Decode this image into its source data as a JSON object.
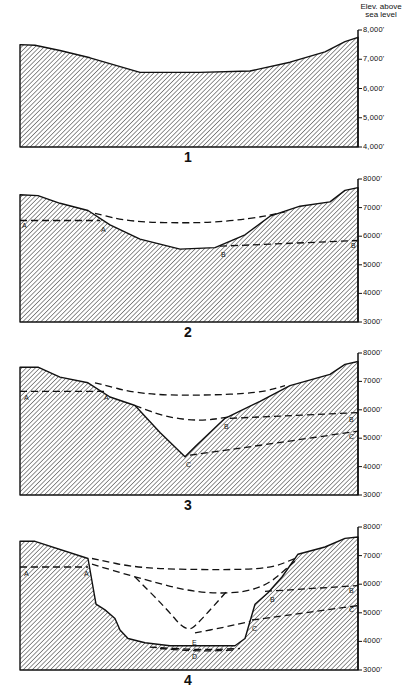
{
  "figure": {
    "axis_title_line1": "Elev. above",
    "axis_title_line2": "sea level",
    "panels": [
      {
        "number": "1",
        "top": 30,
        "bottom": 147,
        "ymax": 8000,
        "ymin": 4000,
        "ticks": [
          "8,000'",
          "7,000'",
          "6,000'",
          "5,000'",
          "4,000'"
        ],
        "tick_values": [
          8000,
          7000,
          6000,
          5000,
          4000
        ],
        "surface": [
          [
            20,
            7500
          ],
          [
            35,
            7480
          ],
          [
            60,
            7300
          ],
          [
            90,
            7050
          ],
          [
            140,
            6550
          ],
          [
            200,
            6550
          ],
          [
            250,
            6600
          ],
          [
            290,
            6900
          ],
          [
            325,
            7250
          ],
          [
            345,
            7600
          ],
          [
            358,
            7750
          ]
        ],
        "dashed": [],
        "labels": []
      },
      {
        "number": "2",
        "top": 179,
        "bottom": 322,
        "ymax": 8000,
        "ymin": 3000,
        "ticks": [
          "8000'",
          "7000'",
          "6000'",
          "5000'",
          "4000'",
          "3000'"
        ],
        "tick_values": [
          8000,
          7000,
          6000,
          5000,
          4000,
          3000
        ],
        "surface": [
          [
            20,
            7450
          ],
          [
            38,
            7420
          ],
          [
            60,
            7150
          ],
          [
            88,
            6900
          ],
          [
            110,
            6400
          ],
          [
            140,
            5900
          ],
          [
            180,
            5550
          ],
          [
            215,
            5600
          ],
          [
            245,
            6050
          ],
          [
            270,
            6700
          ],
          [
            300,
            7050
          ],
          [
            330,
            7200
          ],
          [
            345,
            7600
          ],
          [
            358,
            7700
          ]
        ],
        "dashed": [
          {
            "points": [
              [
                20,
                6550
              ],
              [
                100,
                6550
              ]
            ]
          },
          {
            "points": [
              [
                95,
                6800
              ],
              [
                130,
                6500
              ],
              [
                200,
                6450
              ],
              [
                250,
                6600
              ],
              [
                285,
                6850
              ]
            ]
          },
          {
            "points": [
              [
                220,
                5650
              ],
              [
                358,
                5850
              ]
            ]
          }
        ],
        "labels": [
          {
            "text": "A",
            "x": 22,
            "v": 6350
          },
          {
            "text": "A",
            "x": 101,
            "v": 6200
          },
          {
            "text": "B",
            "x": 221,
            "v": 5350
          },
          {
            "text": "B",
            "x": 351,
            "v": 5650
          }
        ]
      },
      {
        "number": "3",
        "top": 353,
        "bottom": 495,
        "ymax": 8000,
        "ymin": 3000,
        "ticks": [
          "8000'",
          "7000'",
          "6000'",
          "5000'",
          "4000'",
          "3000'"
        ],
        "tick_values": [
          8000,
          7000,
          6000,
          5000,
          4000,
          3000
        ],
        "surface": [
          [
            20,
            7500
          ],
          [
            38,
            7500
          ],
          [
            60,
            7150
          ],
          [
            88,
            6950
          ],
          [
            110,
            6450
          ],
          [
            135,
            6150
          ],
          [
            160,
            5200
          ],
          [
            185,
            4350
          ],
          [
            195,
            4700
          ],
          [
            225,
            5700
          ],
          [
            260,
            6300
          ],
          [
            290,
            6850
          ],
          [
            330,
            7250
          ],
          [
            345,
            7600
          ],
          [
            358,
            7700
          ]
        ],
        "dashed": [
          {
            "points": [
              [
                20,
                6650
              ],
              [
                105,
                6650
              ]
            ]
          },
          {
            "points": [
              [
                95,
                6950
              ],
              [
                140,
                6550
              ],
              [
                200,
                6500
              ],
              [
                260,
                6600
              ],
              [
                285,
                6850
              ]
            ]
          },
          {
            "points": [
              [
                135,
                6150
              ],
              [
                165,
                5750
              ],
              [
                200,
                5600
              ],
              [
                230,
                5750
              ]
            ]
          },
          {
            "points": [
              [
                230,
                5700
              ],
              [
                358,
                5900
              ]
            ]
          },
          {
            "points": [
              [
                190,
                4400
              ],
              [
                270,
                4800
              ],
              [
                358,
                5250
              ]
            ]
          }
        ],
        "labels": [
          {
            "text": "A",
            "x": 24,
            "v": 6400
          },
          {
            "text": "A",
            "x": 104,
            "v": 6400
          },
          {
            "text": "B",
            "x": 224,
            "v": 5400
          },
          {
            "text": "B",
            "x": 349,
            "v": 5650
          },
          {
            "text": "C",
            "x": 186,
            "v": 4050
          },
          {
            "text": "C",
            "x": 349,
            "v": 5050
          }
        ]
      },
      {
        "number": "4",
        "top": 527,
        "bottom": 670,
        "ymax": 8000,
        "ymin": 3000,
        "ticks": [
          "8000'",
          "7000'",
          "6000'",
          "5000'",
          "4000'",
          "3000'"
        ],
        "tick_values": [
          8000,
          7000,
          6000,
          5000,
          4000,
          3000
        ],
        "surface": [
          [
            20,
            7500
          ],
          [
            35,
            7500
          ],
          [
            88,
            6900
          ],
          [
            96,
            5300
          ],
          [
            105,
            5100
          ],
          [
            115,
            4800
          ],
          [
            120,
            4400
          ],
          [
            128,
            4100
          ],
          [
            145,
            3950
          ],
          [
            170,
            3850
          ],
          [
            235,
            3850
          ],
          [
            245,
            4100
          ],
          [
            255,
            5300
          ],
          [
            268,
            5700
          ],
          [
            282,
            6250
          ],
          [
            298,
            7050
          ],
          [
            325,
            7300
          ],
          [
            345,
            7600
          ],
          [
            358,
            7650
          ]
        ],
        "dashed": [
          {
            "points": [
              [
                20,
                6600
              ],
              [
                88,
                6600
              ]
            ]
          },
          {
            "points": [
              [
                92,
                6900
              ],
              [
                140,
                6550
              ],
              [
                220,
                6500
              ],
              [
                270,
                6550
              ],
              [
                295,
                6900
              ]
            ]
          },
          {
            "points": [
              [
                92,
                6700
              ],
              [
                135,
                6250
              ],
              [
                200,
                5650
              ],
              [
                260,
                5750
              ],
              [
                295,
                6800
              ]
            ]
          },
          {
            "points": [
              [
                135,
                6250
              ],
              [
                165,
                5200
              ],
              [
                187,
                4300
              ],
              [
                200,
                4700
              ],
              [
                228,
                5800
              ]
            ]
          },
          {
            "points": [
              [
                195,
                4300
              ],
              [
                225,
                4500
              ],
              [
                250,
                4700
              ]
            ]
          },
          {
            "points": [
              [
                265,
                5750
              ],
              [
                358,
                5950
              ]
            ]
          },
          {
            "points": [
              [
                252,
                4750
              ],
              [
                358,
                5250
              ]
            ]
          },
          {
            "points": [
              [
                150,
                3800
              ],
              [
                200,
                3700
              ],
              [
                240,
                3750
              ]
            ]
          },
          {
            "points": [
              [
                160,
                3750
              ],
              [
                200,
                3650
              ],
              [
                235,
                3700
              ]
            ]
          }
        ],
        "labels": [
          {
            "text": "A",
            "x": 24,
            "v": 6350
          },
          {
            "text": "A",
            "x": 84,
            "v": 6350
          },
          {
            "text": "B",
            "x": 270,
            "v": 5450
          },
          {
            "text": "B",
            "x": 349,
            "v": 5750
          },
          {
            "text": "C",
            "x": 252,
            "v": 4450
          },
          {
            "text": "C",
            "x": 349,
            "v": 5100
          },
          {
            "text": "E",
            "x": 192,
            "v": 3950
          },
          {
            "text": "D",
            "x": 192,
            "v": 3450
          }
        ]
      }
    ]
  },
  "colors": {
    "ink": "#111111",
    "background": "#ffffff"
  }
}
